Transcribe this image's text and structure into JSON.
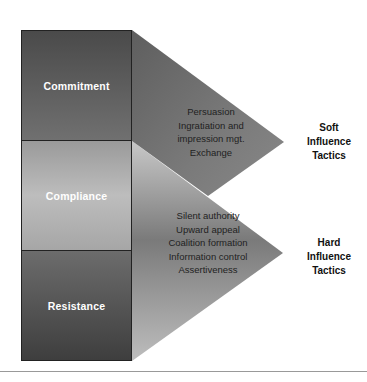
{
  "stages": [
    {
      "label": "Commitment"
    },
    {
      "label": "Compliance"
    },
    {
      "label": "Resistance"
    }
  ],
  "soft": {
    "title_lines": [
      "Soft",
      "Influence",
      "Tactics"
    ],
    "tactics": [
      "Persuasion",
      "Ingratiation and",
      "impression mgt.",
      "Exchange"
    ]
  },
  "hard": {
    "title_lines": [
      "Hard",
      "Influence",
      "Tactics"
    ],
    "tactics": [
      "Silent authority",
      "Upward appeal",
      "Coalition formation",
      "Information control",
      "Assertiveness"
    ]
  },
  "colors": {
    "dark_box": "#5a5a5a",
    "light_box": "#b0b0b0",
    "triangle": "#6e6e6e"
  }
}
